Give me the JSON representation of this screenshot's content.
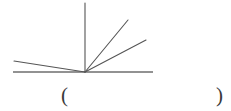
{
  "figure": {
    "stroke_color": "#555555",
    "baseline_color": "#6e6e6e",
    "background_color": "#ffffff",
    "vertex": {
      "x": 85,
      "y": 72
    },
    "baseline": {
      "x1": 13,
      "y1": 72,
      "x2": 153,
      "y2": 72
    },
    "rays": [
      {
        "name": "ray-vertical-up",
        "x1": 85,
        "y1": 72,
        "x2": 85,
        "y2": 3
      },
      {
        "name": "ray-upper-right-steep",
        "x1": 85,
        "y1": 72,
        "x2": 128,
        "y2": 20
      },
      {
        "name": "ray-upper-right-shallow",
        "x1": 85,
        "y1": 72,
        "x2": 146,
        "y2": 40
      },
      {
        "name": "ray-upper-left",
        "x1": 85,
        "y1": 72,
        "x2": 14,
        "y2": 61
      }
    ]
  },
  "answer": {
    "open_paren": "(",
    "close_paren": ")",
    "value": ""
  }
}
